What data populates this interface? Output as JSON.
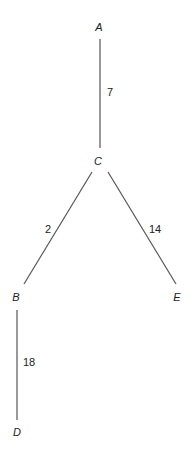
{
  "diagram": {
    "type": "tree",
    "nodes": [
      {
        "id": "A",
        "label": "A",
        "x": 99,
        "y": 31
      },
      {
        "id": "C",
        "label": "C",
        "x": 98,
        "y": 165
      },
      {
        "id": "B",
        "label": "B",
        "x": 16,
        "y": 301
      },
      {
        "id": "E",
        "label": "E",
        "x": 177,
        "y": 301
      },
      {
        "id": "D",
        "label": "D",
        "x": 17,
        "y": 436
      }
    ],
    "edges": [
      {
        "from": "A",
        "to": "C",
        "weight": "7",
        "x1": 100,
        "y1": 39,
        "x2": 100,
        "y2": 148,
        "lx": 107,
        "ly": 96
      },
      {
        "from": "C",
        "to": "B",
        "weight": "2",
        "x1": 92,
        "y1": 172,
        "x2": 24,
        "y2": 284,
        "lx": 45,
        "ly": 233
      },
      {
        "from": "C",
        "to": "E",
        "weight": "14",
        "x1": 108,
        "y1": 172,
        "x2": 176,
        "y2": 284,
        "lx": 149,
        "ly": 233
      },
      {
        "from": "B",
        "to": "D",
        "weight": "18",
        "x1": 17,
        "y1": 310,
        "x2": 17,
        "y2": 420,
        "lx": 23,
        "ly": 366
      }
    ]
  }
}
